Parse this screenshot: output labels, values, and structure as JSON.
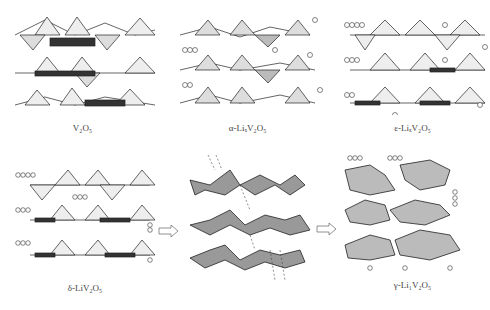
{
  "figure": {
    "panels": [
      {
        "id": "v2o5",
        "label": "V₂O₅"
      },
      {
        "id": "alpha",
        "label": "α-LiₓV₂O₅"
      },
      {
        "id": "epsilon",
        "label": "ε-LiₓV₂O₅"
      },
      {
        "id": "delta",
        "label": "δ-LiV₂O₅"
      },
      {
        "id": "transition",
        "label": ""
      },
      {
        "id": "gamma",
        "label": "γ-Li₁V₂O₅"
      }
    ],
    "arrows": [
      "delta-to-transition",
      "transition-to-gamma"
    ],
    "colors": {
      "line": "#222222",
      "fill_light": "#e8e8e8",
      "fill_dark": "#9a9a9a",
      "background": "#ffffff"
    }
  }
}
